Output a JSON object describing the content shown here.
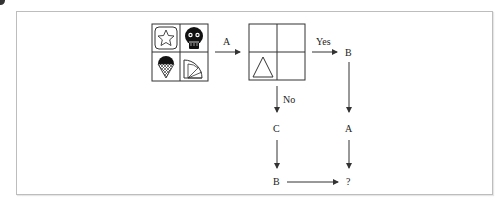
{
  "diagram": {
    "type": "logic-puzzle-flow",
    "source_grid": {
      "cells": [
        {
          "pos": "top-left",
          "icon": "star-in-rounded-square"
        },
        {
          "pos": "top-right",
          "icon": "skull-face"
        },
        {
          "pos": "bottom-left",
          "icon": "ice-cream-cone"
        },
        {
          "pos": "bottom-right",
          "icon": "quarter-circle-fan"
        }
      ]
    },
    "target_grid": {
      "cells": [
        {
          "pos": "top-left",
          "icon": ""
        },
        {
          "pos": "top-right",
          "icon": ""
        },
        {
          "pos": "bottom-left",
          "icon": "triangle"
        },
        {
          "pos": "bottom-right",
          "icon": ""
        }
      ]
    },
    "labels": {
      "a1": "A",
      "yes": "Yes",
      "no": "No",
      "b_top": "B",
      "a_right": "A",
      "c": "C",
      "b_bottom": "B",
      "question": "?"
    },
    "colors": {
      "line": "#333333",
      "frame": "#bdbdbd"
    }
  }
}
